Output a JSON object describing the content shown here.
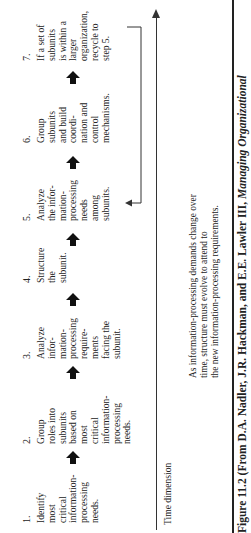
{
  "steps": [
    {
      "number": "1.",
      "text": "Identify\nmost\ncritical\ninformation-\nprocessing\nneeds."
    },
    {
      "number": "2.",
      "text": "Group\nroles into\nsubunits\nbased on\nmost\ncritical\ninformation-\nprocessing\nneeds."
    },
    {
      "number": "3.",
      "text": "Analyze\ninfor-\nmation-\nprocessing\nrequire-\nments\nfacing the\nsubunit."
    },
    {
      "number": "4.",
      "text": "Structure\nthe\nsubunit."
    },
    {
      "number": "5.",
      "text": "Analyze\nthe infor-\nmation-\nprocessing\nneeds\namong\nsubunits."
    },
    {
      "number": "6.",
      "text": "Group\nsubunits\nand build\ncoordi-\nnation and\ncontrol\nmechanisms."
    },
    {
      "number": "7.",
      "text": "If a set of\nsubunits\nis within a\nlarger\norganization,\nrecycle to\nstep 5."
    }
  ],
  "arrows": [
    "up-arrow",
    "up-arrow",
    "up-arrow",
    "up-arrow",
    "up-arrow",
    "up-arrow"
  ],
  "timeline": {
    "label": "Time dimension",
    "note": "As information-processing demands change over\ntime, structure must evolve to attend to\nthe new information-processing requirements."
  },
  "caption": {
    "figure": "Figure 11.2",
    "source_prefix": "(From D.A. Nadler, J.R. Hackman, and E.E. Lawler III,",
    "title": "Managing Organizational"
  }
}
